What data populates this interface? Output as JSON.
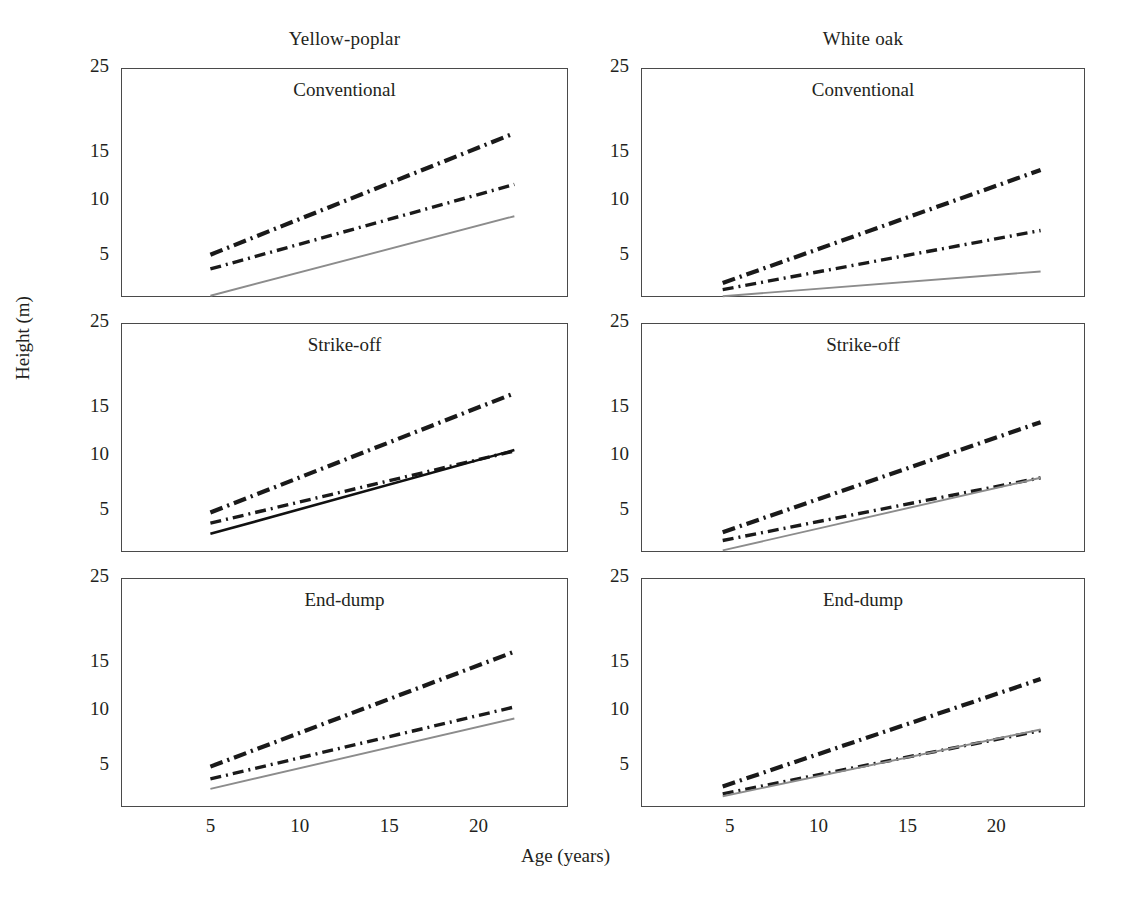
{
  "figure": {
    "xlabel": "Age (years)",
    "ylabel": "Height (m)",
    "column_titles": [
      "Yellow-poplar",
      "White oak"
    ],
    "row_titles": [
      "Conventional",
      "Strike-off",
      "End-dump"
    ]
  },
  "axes": {
    "yticks": [
      "25",
      "15",
      "10",
      "5"
    ],
    "ytick_values": [
      25,
      15,
      10,
      5
    ],
    "ytick_frac": [
      1.0,
      0.63,
      0.42,
      0.18
    ],
    "xticks": [
      "5",
      "10",
      "15",
      "20"
    ],
    "xtick_values": [
      5,
      10,
      15,
      20
    ],
    "xlim": [
      0,
      25
    ],
    "ylim": [
      0,
      25
    ]
  },
  "colors": {
    "axis": "#4a4a4a",
    "text": "#231f20",
    "series_top": "#1a1a1a",
    "series_mid": "#1a1a1a",
    "series_low_gray": "#8c8c8c",
    "series_low_black": "#111111",
    "background": "#ffffff"
  },
  "chart_data": {
    "type": "line",
    "xlabel": "Age (years)",
    "ylabel": "Height (m)",
    "xlim": [
      0,
      25
    ],
    "ylim": [
      0,
      25
    ],
    "xticks": [
      5,
      10,
      15,
      20
    ],
    "yticks": [
      5,
      10,
      15,
      25
    ],
    "grid": false,
    "legend": "none",
    "panels": [
      {
        "id": "yellow-poplar-conventional",
        "column": "Yellow-poplar",
        "row": "Conventional",
        "series": [
          {
            "name": "upper",
            "style": "dash-dot-thick",
            "color": "#1a1a1a",
            "x": [
              5,
              22
            ],
            "y": [
              5.1,
              17.3
            ]
          },
          {
            "name": "middle",
            "style": "dash-dot-medium",
            "color": "#1a1a1a",
            "x": [
              5,
              22
            ],
            "y": [
              3.4,
              11.7
            ]
          },
          {
            "name": "lower",
            "style": "solid-thin-gray",
            "color": "#8c8c8c",
            "x": [
              5,
              22
            ],
            "y": [
              0.15,
              8.6
            ]
          }
        ]
      },
      {
        "id": "white-oak-conventional",
        "column": "White oak",
        "row": "Conventional",
        "series": [
          {
            "name": "upper",
            "style": "dash-dot-thick",
            "color": "#1a1a1a",
            "x": [
              4.6,
              22.5
            ],
            "y": [
              1.7,
              13.2
            ]
          },
          {
            "name": "middle",
            "style": "dash-dot-medium",
            "color": "#1a1a1a",
            "x": [
              4.6,
              22.5
            ],
            "y": [
              0.9,
              7.3
            ]
          },
          {
            "name": "lower",
            "style": "solid-thin-gray",
            "color": "#8c8c8c",
            "x": [
              4.6,
              22.5
            ],
            "y": [
              0.1,
              3.1
            ]
          }
        ]
      },
      {
        "id": "yellow-poplar-strike-off",
        "column": "Yellow-poplar",
        "row": "Strike-off",
        "series": [
          {
            "name": "upper",
            "style": "dash-dot-thick",
            "color": "#1a1a1a",
            "x": [
              5,
              22
            ],
            "y": [
              4.8,
              16.7
            ]
          },
          {
            "name": "middle",
            "style": "dash-dot-medium",
            "color": "#1a1a1a",
            "x": [
              5,
              22
            ],
            "y": [
              3.5,
              10.5
            ]
          },
          {
            "name": "lower",
            "style": "solid-thick-black",
            "color": "#111111",
            "x": [
              5,
              22
            ],
            "y": [
              2.2,
              10.6
            ]
          }
        ]
      },
      {
        "id": "white-oak-strike-off",
        "column": "White oak",
        "row": "Strike-off",
        "series": [
          {
            "name": "upper",
            "style": "dash-dot-thick",
            "color": "#1a1a1a",
            "x": [
              4.6,
              22.5
            ],
            "y": [
              2.4,
              13.5
            ]
          },
          {
            "name": "middle",
            "style": "dash-dot-medium",
            "color": "#1a1a1a",
            "x": [
              4.6,
              22.5
            ],
            "y": [
              1.4,
              8.0
            ]
          },
          {
            "name": "lower",
            "style": "solid-thin-gray",
            "color": "#8c8c8c",
            "x": [
              4.6,
              22.5
            ],
            "y": [
              0.2,
              8.0
            ]
          }
        ]
      },
      {
        "id": "yellow-poplar-end-dump",
        "column": "Yellow-poplar",
        "row": "End-dump",
        "series": [
          {
            "name": "upper",
            "style": "dash-dot-thick",
            "color": "#1a1a1a",
            "x": [
              5,
              22
            ],
            "y": [
              4.9,
              16.3
            ]
          },
          {
            "name": "middle",
            "style": "dash-dot-medium",
            "color": "#1a1a1a",
            "x": [
              5,
              22
            ],
            "y": [
              3.4,
              10.4
            ]
          },
          {
            "name": "lower",
            "style": "solid-thin-gray",
            "color": "#8c8c8c",
            "x": [
              5,
              22
            ],
            "y": [
              2.2,
              9.3
            ]
          }
        ]
      },
      {
        "id": "white-oak-end-dump",
        "column": "White oak",
        "row": "End-dump",
        "series": [
          {
            "name": "upper",
            "style": "dash-dot-thick",
            "color": "#1a1a1a",
            "x": [
              4.6,
              22.5
            ],
            "y": [
              2.5,
              13.3
            ]
          },
          {
            "name": "middle",
            "style": "dash-dot-medium",
            "color": "#1a1a1a",
            "x": [
              4.6,
              22.5
            ],
            "y": [
              1.6,
              8.2
            ]
          },
          {
            "name": "lower",
            "style": "solid-thin-gray",
            "color": "#8c8c8c",
            "x": [
              4.6,
              22.5
            ],
            "y": [
              1.3,
              8.3
            ]
          }
        ]
      }
    ]
  },
  "geometry": {
    "panels_px": [
      {
        "left": 121,
        "top": 68,
        "width": 447,
        "height": 229
      },
      {
        "left": 641,
        "top": 68,
        "width": 444,
        "height": 229
      },
      {
        "left": 121,
        "top": 323,
        "width": 447,
        "height": 229
      },
      {
        "left": 641,
        "top": 323,
        "width": 444,
        "height": 229
      },
      {
        "left": 121,
        "top": 578,
        "width": 447,
        "height": 229
      },
      {
        "left": 641,
        "top": 578,
        "width": 444,
        "height": 229
      }
    ]
  }
}
